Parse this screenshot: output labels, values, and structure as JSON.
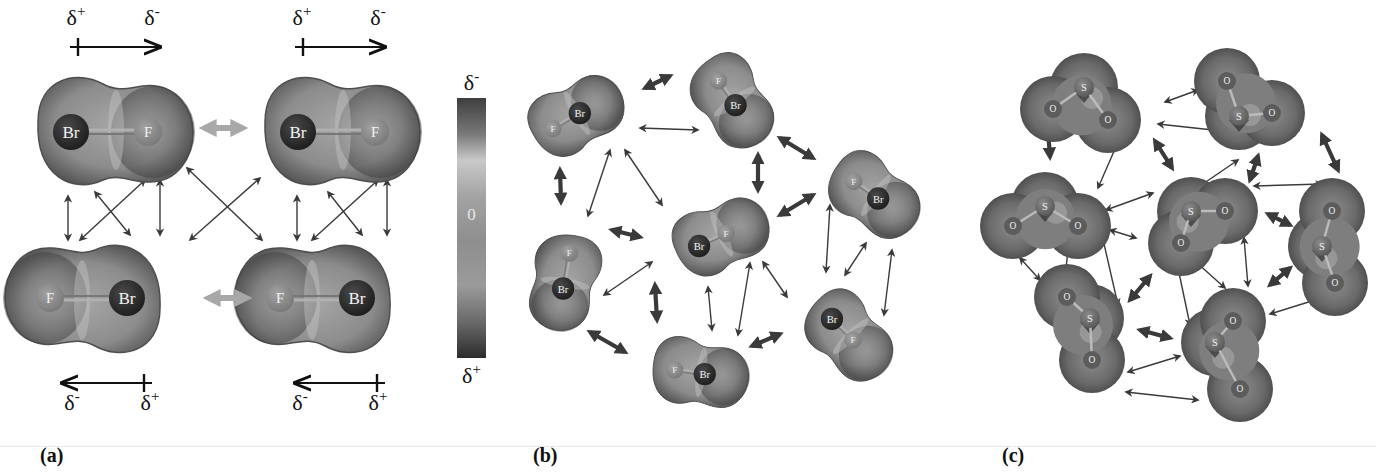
{
  "figure": {
    "panels": [
      {
        "id": "a",
        "label": "(a)",
        "x": 40
      },
      {
        "id": "b",
        "label": "(b)",
        "x": 533
      },
      {
        "id": "c",
        "label": "(c)",
        "x": 1002
      }
    ]
  },
  "colors": {
    "molecule_fill": "#8a8a8a",
    "molecule_dark": "#4a4a4a",
    "molecule_light": "#b5b5b5",
    "atom_br": "#2b2b2b",
    "atom_f": "#8f8f8f",
    "atom_s": "#707070",
    "atom_o": "#5e5e5e",
    "arrow": "#3a3a3a",
    "arrow_light": "#a8a8a8",
    "text": "#111111"
  },
  "dipole_arrows": [
    {
      "x1": 70,
      "x2": 160,
      "y": 47,
      "dir": "right",
      "plus_label": "δ+",
      "minus_label": "δ-",
      "plus_x": 76,
      "minus_x": 152,
      "label_y": 25
    },
    {
      "x1": 295,
      "x2": 385,
      "y": 47,
      "dir": "right",
      "plus_label": "δ+",
      "minus_label": "δ-",
      "plus_x": 302,
      "minus_x": 378,
      "label_y": 25
    },
    {
      "x1": 62,
      "x2": 152,
      "y": 383,
      "dir": "left",
      "plus_label": "δ+",
      "minus_label": "δ-",
      "plus_x": 150,
      "minus_x": 72,
      "label_y": 410
    },
    {
      "x1": 295,
      "x2": 385,
      "y": 383,
      "dir": "left",
      "plus_label": "δ+",
      "minus_label": "δ-",
      "plus_x": 378,
      "minus_x": 300,
      "label_y": 410
    }
  ],
  "color_scale": {
    "top_label": "δ-",
    "middle_label": "0",
    "bottom_label": "δ+",
    "x": 457,
    "y": 98,
    "width": 29,
    "height": 260
  },
  "panel_a": {
    "molecules": [
      {
        "cx": 98,
        "cy": 132,
        "angle": 0,
        "atoms": [
          {
            "el": "Br",
            "dx": -27
          },
          {
            "el": "F",
            "dx": 50
          }
        ]
      },
      {
        "cx": 325,
        "cy": 132,
        "angle": 0,
        "atoms": [
          {
            "el": "Br",
            "dx": -27
          },
          {
            "el": "F",
            "dx": 50
          }
        ]
      },
      {
        "cx": 100,
        "cy": 298,
        "angle": 180,
        "atoms": [
          {
            "el": "Br",
            "dx": -27
          },
          {
            "el": "F",
            "dx": 50
          }
        ]
      },
      {
        "cx": 330,
        "cy": 298,
        "angle": 180,
        "atoms": [
          {
            "el": "Br",
            "dx": -27
          },
          {
            "el": "F",
            "dx": 50
          }
        ]
      }
    ],
    "light_arrows": [
      {
        "x1": 204,
        "y1": 128,
        "x2": 243,
        "y2": 128
      },
      {
        "x1": 208,
        "y1": 298,
        "x2": 247,
        "y2": 298
      }
    ],
    "arrows": [
      {
        "x1": 68,
        "y1": 196,
        "x2": 68,
        "y2": 240
      },
      {
        "x1": 95,
        "y1": 192,
        "x2": 130,
        "y2": 235
      },
      {
        "x1": 145,
        "y1": 180,
        "x2": 80,
        "y2": 240
      },
      {
        "x1": 160,
        "y1": 180,
        "x2": 160,
        "y2": 235
      },
      {
        "x1": 187,
        "y1": 168,
        "x2": 262,
        "y2": 240
      },
      {
        "x1": 260,
        "y1": 178,
        "x2": 190,
        "y2": 240
      },
      {
        "x1": 297,
        "y1": 196,
        "x2": 297,
        "y2": 240
      },
      {
        "x1": 328,
        "y1": 192,
        "x2": 362,
        "y2": 235
      },
      {
        "x1": 378,
        "y1": 180,
        "x2": 312,
        "y2": 240
      },
      {
        "x1": 387,
        "y1": 180,
        "x2": 387,
        "y2": 235
      }
    ]
  },
  "panel_b": {
    "molecules": [
      {
        "cx": 568,
        "cy": 120,
        "angle": -30,
        "atoms": [
          {
            "el": "F",
            "dx": -28
          },
          {
            "el": "Br",
            "dx": 22
          }
        ]
      },
      {
        "cx": 727,
        "cy": 93,
        "angle": 55,
        "atoms": [
          {
            "el": "F",
            "dx": -24
          },
          {
            "el": "Br",
            "dx": 24
          }
        ]
      },
      {
        "cx": 712,
        "cy": 240,
        "angle": -25,
        "atoms": [
          {
            "el": "Br",
            "dx": -23
          },
          {
            "el": "F",
            "dx": 25
          }
        ]
      },
      {
        "cx": 566,
        "cy": 272,
        "angle": 100,
        "atoms": [
          {
            "el": "F",
            "dx": -31
          },
          {
            "el": "Br",
            "dx": 27
          }
        ]
      },
      {
        "cx": 866,
        "cy": 190,
        "angle": 35,
        "atoms": [
          {
            "el": "F",
            "dx": -24
          },
          {
            "el": "Br",
            "dx": 24
          }
        ]
      },
      {
        "cx": 842,
        "cy": 329,
        "angle": 45,
        "atoms": [
          {
            "el": "Br",
            "dx": -23
          },
          {
            "el": "F",
            "dx": 25
          }
        ]
      },
      {
        "cx": 690,
        "cy": 372,
        "angle": 8,
        "atoms": [
          {
            "el": "F",
            "dx": -25
          },
          {
            "el": "Br",
            "dx": 24
          }
        ]
      }
    ],
    "thick_arrows": [
      {
        "x1": 645,
        "y1": 88,
        "x2": 670,
        "y2": 76
      },
      {
        "x1": 780,
        "y1": 138,
        "x2": 813,
        "y2": 158
      },
      {
        "x1": 758,
        "y1": 155,
        "x2": 758,
        "y2": 190
      },
      {
        "x1": 780,
        "y1": 215,
        "x2": 813,
        "y2": 195
      },
      {
        "x1": 560,
        "y1": 170,
        "x2": 561,
        "y2": 202
      },
      {
        "x1": 612,
        "y1": 230,
        "x2": 640,
        "y2": 237
      },
      {
        "x1": 655,
        "y1": 285,
        "x2": 657,
        "y2": 320
      },
      {
        "x1": 590,
        "y1": 332,
        "x2": 625,
        "y2": 352
      },
      {
        "x1": 752,
        "y1": 346,
        "x2": 780,
        "y2": 334
      }
    ],
    "arrows": [
      {
        "x1": 640,
        "y1": 128,
        "x2": 698,
        "y2": 130
      },
      {
        "x1": 610,
        "y1": 150,
        "x2": 588,
        "y2": 216
      },
      {
        "x1": 625,
        "y1": 150,
        "x2": 662,
        "y2": 205
      },
      {
        "x1": 604,
        "y1": 295,
        "x2": 652,
        "y2": 262
      },
      {
        "x1": 708,
        "y1": 287,
        "x2": 712,
        "y2": 330
      },
      {
        "x1": 750,
        "y1": 263,
        "x2": 738,
        "y2": 335
      },
      {
        "x1": 763,
        "y1": 262,
        "x2": 787,
        "y2": 297
      },
      {
        "x1": 830,
        "y1": 205,
        "x2": 826,
        "y2": 272
      },
      {
        "x1": 866,
        "y1": 243,
        "x2": 845,
        "y2": 275
      },
      {
        "x1": 892,
        "y1": 250,
        "x2": 884,
        "y2": 315
      }
    ]
  },
  "panel_c": {
    "molecules": [
      {
        "cx": 1088,
        "cy": 102,
        "angle": 0,
        "S": [
          -4,
          -15
        ],
        "O": [
          [
            -35,
            7
          ],
          [
            20,
            18
          ]
        ]
      },
      {
        "cx": 1247,
        "cy": 106,
        "angle": 0,
        "S": [
          -8,
          10
        ],
        "O": [
          [
            -20,
            -25
          ],
          [
            25,
            7
          ]
        ]
      },
      {
        "cx": 1043,
        "cy": 211,
        "angle": 0,
        "S": [
          2,
          -5
        ],
        "O": [
          [
            -30,
            15
          ],
          [
            35,
            15
          ]
        ]
      },
      {
        "cx": 1195,
        "cy": 215,
        "angle": 0,
        "S": [
          -4,
          -4
        ],
        "O": [
          [
            30,
            -4
          ],
          [
            -14,
            28
          ]
        ]
      },
      {
        "cx": 1330,
        "cy": 246,
        "angle": 0,
        "S": [
          -8,
          0
        ],
        "O": [
          [
            2,
            -35
          ],
          [
            5,
            37
          ]
        ]
      },
      {
        "cx": 1082,
        "cy": 330,
        "angle": 0,
        "S": [
          8,
          -12
        ],
        "O": [
          [
            -15,
            -33
          ],
          [
            10,
            30
          ]
        ]
      },
      {
        "cx": 1225,
        "cy": 349,
        "angle": 0,
        "S": [
          -10,
          -7
        ],
        "O": [
          [
            8,
            -28
          ],
          [
            15,
            40
          ]
        ]
      }
    ],
    "thick_arrows": [
      {
        "x1": 1048,
        "y1": 130,
        "x2": 1050,
        "y2": 157
      },
      {
        "x1": 1155,
        "y1": 141,
        "x2": 1172,
        "y2": 168
      },
      {
        "x1": 1258,
        "y1": 156,
        "x2": 1250,
        "y2": 180
      },
      {
        "x1": 1322,
        "y1": 135,
        "x2": 1338,
        "y2": 170
      },
      {
        "x1": 1268,
        "y1": 214,
        "x2": 1290,
        "y2": 225
      },
      {
        "x1": 1270,
        "y1": 285,
        "x2": 1290,
        "y2": 268
      },
      {
        "x1": 1140,
        "y1": 330,
        "x2": 1170,
        "y2": 338
      },
      {
        "x1": 1130,
        "y1": 300,
        "x2": 1150,
        "y2": 276
      }
    ],
    "arrows": [
      {
        "x1": 1165,
        "y1": 102,
        "x2": 1198,
        "y2": 90
      },
      {
        "x1": 1158,
        "y1": 124,
        "x2": 1222,
        "y2": 131
      },
      {
        "x1": 1118,
        "y1": 142,
        "x2": 1098,
        "y2": 188
      },
      {
        "x1": 1197,
        "y1": 188,
        "x2": 1238,
        "y2": 160
      },
      {
        "x1": 1254,
        "y1": 186,
        "x2": 1322,
        "y2": 184
      },
      {
        "x1": 1106,
        "y1": 210,
        "x2": 1153,
        "y2": 193
      },
      {
        "x1": 1110,
        "y1": 230,
        "x2": 1136,
        "y2": 238
      },
      {
        "x1": 1020,
        "y1": 258,
        "x2": 1040,
        "y2": 280
      },
      {
        "x1": 1068,
        "y1": 250,
        "x2": 1065,
        "y2": 278
      },
      {
        "x1": 1102,
        "y1": 235,
        "x2": 1118,
        "y2": 305
      },
      {
        "x1": 1178,
        "y1": 268,
        "x2": 1190,
        "y2": 325
      },
      {
        "x1": 1196,
        "y1": 262,
        "x2": 1225,
        "y2": 288
      },
      {
        "x1": 1244,
        "y1": 238,
        "x2": 1248,
        "y2": 286
      },
      {
        "x1": 1270,
        "y1": 314,
        "x2": 1315,
        "y2": 300
      },
      {
        "x1": 1128,
        "y1": 372,
        "x2": 1180,
        "y2": 356
      },
      {
        "x1": 1126,
        "y1": 392,
        "x2": 1198,
        "y2": 400
      }
    ]
  }
}
